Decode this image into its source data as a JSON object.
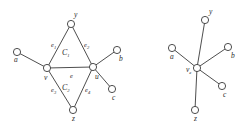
{
  "figure": {
    "background_color": "#ffffff",
    "stroke_color": "#3a3a3a",
    "text_color": "#2b2b2b",
    "node_fill": "#ffffff"
  },
  "left_graph": {
    "name": "graph-before-contraction",
    "vertices": [
      {
        "id": "y",
        "label": "y",
        "x": 71,
        "y": 24,
        "label_x": 74,
        "label_y": 17
      },
      {
        "id": "a",
        "label": "a",
        "x": 17,
        "y": 52,
        "label_x": 14,
        "label_y": 62
      },
      {
        "id": "v",
        "label": "v",
        "x": 47,
        "y": 68,
        "label_x": 44,
        "label_y": 80
      },
      {
        "id": "u",
        "label": "u",
        "x": 93,
        "y": 67,
        "label_x": 95,
        "label_y": 79
      },
      {
        "id": "b",
        "label": "b",
        "x": 117,
        "y": 50,
        "label_x": 119,
        "label_y": 61
      },
      {
        "id": "c",
        "label": "c",
        "x": 112,
        "y": 89,
        "label_x": 112,
        "label_y": 100
      },
      {
        "id": "z",
        "label": "z",
        "x": 73,
        "y": 110,
        "label_x": 72,
        "label_y": 121
      }
    ],
    "edges": [
      {
        "id": "e1",
        "from": "v",
        "to": "y",
        "label": "e",
        "subscript": "1",
        "label_x": 51,
        "label_y": 47
      },
      {
        "id": "e2",
        "from": "y",
        "to": "u",
        "label": "e",
        "subscript": "2",
        "label_x": 84,
        "label_y": 47
      },
      {
        "id": "e",
        "from": "v",
        "to": "u",
        "label": "e",
        "subscript": "",
        "label_x": 70,
        "label_y": 78
      },
      {
        "id": "e3",
        "from": "v",
        "to": "z",
        "label": "e",
        "subscript": "3",
        "label_x": 51,
        "label_y": 92
      },
      {
        "id": "e4",
        "from": "z",
        "to": "u",
        "label": "e",
        "subscript": "4",
        "label_x": 85,
        "label_y": 92
      },
      {
        "id": "av",
        "from": "a",
        "to": "v",
        "label": "",
        "subscript": "",
        "label_x": 0,
        "label_y": 0
      },
      {
        "id": "ub",
        "from": "u",
        "to": "b",
        "label": "",
        "subscript": "",
        "label_x": 0,
        "label_y": 0
      },
      {
        "id": "uc",
        "from": "u",
        "to": "c",
        "label": "",
        "subscript": "",
        "label_x": 0,
        "label_y": 0
      }
    ],
    "faces": [
      {
        "id": "C1",
        "label": "C",
        "subscript": "1",
        "x": 67,
        "y": 55
      },
      {
        "id": "C2",
        "label": "C",
        "subscript": "2",
        "x": 67,
        "y": 90
      }
    ]
  },
  "right_graph": {
    "name": "graph-after-contraction",
    "vertices": [
      {
        "id": "ve",
        "label": "v",
        "subscript": "e",
        "x": 197,
        "y": 68,
        "label_x": 187,
        "label_y": 72
      },
      {
        "id": "y",
        "label": "y",
        "subscript": "",
        "x": 205,
        "y": 20,
        "label_x": 209,
        "label_y": 14
      },
      {
        "id": "a",
        "label": "a",
        "subscript": "",
        "x": 172,
        "y": 48,
        "label_x": 170,
        "label_y": 59
      },
      {
        "id": "b",
        "label": "b",
        "subscript": "",
        "x": 228,
        "y": 47,
        "label_x": 231,
        "label_y": 58
      },
      {
        "id": "c",
        "label": "c",
        "subscript": "",
        "x": 222,
        "y": 86,
        "label_x": 223,
        "label_y": 97
      },
      {
        "id": "z",
        "label": "z",
        "subscript": "",
        "x": 195,
        "y": 110,
        "label_x": 194,
        "label_y": 121
      }
    ],
    "edges": [
      {
        "id": "ve-y",
        "from": "ve",
        "to": "y"
      },
      {
        "id": "ve-a",
        "from": "ve",
        "to": "a"
      },
      {
        "id": "ve-b",
        "from": "ve",
        "to": "b"
      },
      {
        "id": "ve-c",
        "from": "ve",
        "to": "c"
      },
      {
        "id": "ve-z",
        "from": "ve",
        "to": "z"
      }
    ]
  }
}
